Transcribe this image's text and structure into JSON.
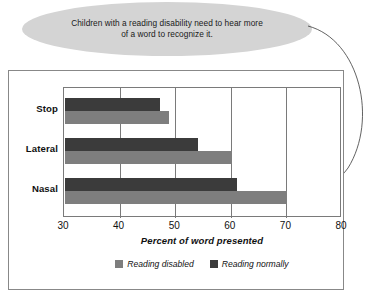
{
  "callout": {
    "text": "Children with a reading disability need to hear more of a word to recognize it."
  },
  "colors": {
    "reading_disabled": "#7e7e7e",
    "reading_normally": "#3b3b3b",
    "callout_fill": "#d4d4d4",
    "frame_stroke": "#888888",
    "axis_stroke": "#7a7a7a"
  },
  "chart_data": {
    "type": "bar",
    "orientation": "horizontal",
    "title": "",
    "xlabel": "Percent of word presented",
    "ylabel": "",
    "xlim": [
      30,
      80
    ],
    "xticks": [
      30,
      40,
      50,
      60,
      70,
      80
    ],
    "grid": true,
    "grid_axis": "x",
    "legend_position": "bottom",
    "categories": [
      "Stop",
      "Lateral",
      "Nasal"
    ],
    "series": [
      {
        "name": "Reading normally",
        "color": "#3b3b3b",
        "values": [
          47.0,
          54.0,
          61.0
        ]
      },
      {
        "name": "Reading disabled",
        "color": "#7e7e7e",
        "values": [
          48.7,
          60.0,
          70.0
        ]
      }
    ],
    "annotations": [
      {
        "text": "Children with a reading disability need to hear more of a word to recognize it.",
        "points_to": {
          "category": "Nasal",
          "series": "Reading disabled",
          "value": 70.0
        }
      }
    ]
  },
  "legend": {
    "items": [
      {
        "label": "Reading disabled",
        "color": "#7e7e7e"
      },
      {
        "label": "Reading normally",
        "color": "#3b3b3b"
      }
    ]
  }
}
